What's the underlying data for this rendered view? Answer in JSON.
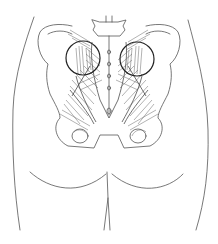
{
  "figure": {
    "highlights": [
      {
        "name": "left-sacroiliac-region",
        "cx": 83,
        "cy": 58,
        "r": 17
      },
      {
        "name": "right-sacroiliac-region",
        "cx": 137,
        "cy": 59,
        "r": 17
      }
    ],
    "colors": {
      "line": "#555555",
      "circle": "#222222",
      "background": "#ffffff"
    }
  }
}
